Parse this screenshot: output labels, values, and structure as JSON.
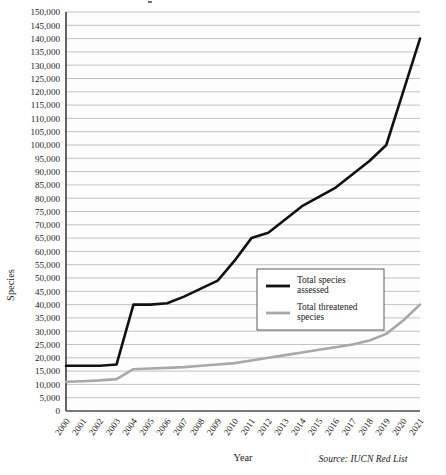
{
  "chart_data": {
    "type": "line",
    "title": "",
    "xlabel": "Year",
    "ylabel": "Species",
    "source": "Source: IUCN Red List",
    "grid": true,
    "legend_position": "inside-right",
    "ylim": [
      0,
      150000
    ],
    "ytick_step": 5000,
    "categories": [
      "2000",
      "2001",
      "2002",
      "2003",
      "2004",
      "2005",
      "2006",
      "2007",
      "2008",
      "2009",
      "2010",
      "2011",
      "2012",
      "2013",
      "2014",
      "2015",
      "2016",
      "2017",
      "2018",
      "2019",
      "2020",
      "2021"
    ],
    "ytick_labels": [
      "150,000",
      "145,000",
      "140,000",
      "135,000",
      "130,000",
      "125,000",
      "120,000",
      "115,000",
      "110,000",
      "105,000",
      "100,000",
      "95,000",
      "90,000",
      "85,000",
      "80,000",
      "75,000",
      "70,000",
      "65,000",
      "60,000",
      "55,000",
      "50,000",
      "45,000",
      "40,000",
      "35,000",
      "30,000",
      "25,000",
      "20,000",
      "15,000",
      "10,000",
      "5,000",
      "0"
    ],
    "series": [
      {
        "name": "Total species assessed",
        "color": "#111111",
        "width": 2.6,
        "values": [
          17000,
          17000,
          17000,
          17500,
          40000,
          40000,
          40500,
          43000,
          46000,
          49000,
          56500,
          65000,
          67000,
          72000,
          77000,
          80500,
          84000,
          89000,
          94000,
          100000,
          120000,
          140000
        ]
      },
      {
        "name": "Total threatened species",
        "color": "#a8a8a8",
        "width": 2.6,
        "values": [
          11000,
          11200,
          11500,
          12000,
          15700,
          16000,
          16200,
          16500,
          17000,
          17500,
          18000,
          19000,
          20000,
          21000,
          22000,
          23000,
          24000,
          25000,
          26500,
          29000,
          34000,
          40000
        ]
      }
    ],
    "legend": [
      {
        "label_line1": "Total species",
        "label_line2": "assessed",
        "color": "#111111"
      },
      {
        "label_line1": "Total threatened",
        "label_line2": "species",
        "color": "#a8a8a8"
      }
    ]
  }
}
